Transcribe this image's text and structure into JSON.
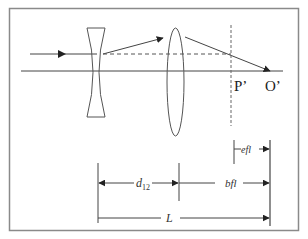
{
  "diagram": {
    "colors": {
      "line": "#333333",
      "frame": "#888888",
      "background": "#ffffff"
    },
    "labels": {
      "principal_point": "P’",
      "focal_point": "O’",
      "lens_separation": "d",
      "lens_separation_sub": "12",
      "effective_focal_length": "efl",
      "back_focal_length": "bfl",
      "total_length": "L"
    },
    "elements": [
      {
        "id": "incoming-ray",
        "kind": "ray"
      },
      {
        "id": "optical-axis",
        "kind": "axis"
      },
      {
        "id": "diverging-lens",
        "kind": "lens",
        "type": "concave"
      },
      {
        "id": "converging-lens",
        "kind": "lens",
        "type": "convex"
      },
      {
        "id": "principal-plane",
        "kind": "dashed-line"
      },
      {
        "id": "dim-d12",
        "kind": "dimension"
      },
      {
        "id": "dim-bfl",
        "kind": "dimension"
      },
      {
        "id": "dim-efl",
        "kind": "dimension"
      },
      {
        "id": "dim-L",
        "kind": "dimension"
      }
    ]
  }
}
